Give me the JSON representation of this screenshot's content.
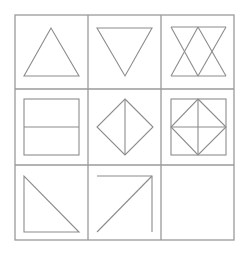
{
  "puzzle": {
    "rows": 3,
    "cols": 3,
    "line_color": "#8c8c8c",
    "grid_color": "#9a9a9a",
    "background": "#ffffff",
    "cells": [
      {
        "row": 0,
        "col": 0,
        "shape": "triangle-up"
      },
      {
        "row": 0,
        "col": 1,
        "shape": "triangle-down"
      },
      {
        "row": 0,
        "col": 2,
        "shape": "overlapping-up-down-triangles"
      },
      {
        "row": 1,
        "col": 0,
        "shape": "rectangle-horizontal-divider"
      },
      {
        "row": 1,
        "col": 1,
        "shape": "diamond-vertical-divider"
      },
      {
        "row": 1,
        "col": 2,
        "shape": "square-inscribed-diamond-cross"
      },
      {
        "row": 2,
        "col": 0,
        "shape": "right-triangle-lower-left"
      },
      {
        "row": 2,
        "col": 1,
        "shape": "open-right-angle-with-diagonal"
      },
      {
        "row": 2,
        "col": 2,
        "shape": "empty-answer-cell"
      }
    ]
  }
}
